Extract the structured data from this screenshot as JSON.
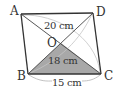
{
  "figure": {
    "type": "parallelogram-diagram",
    "vertices": {
      "A": {
        "label": "A",
        "x": 21,
        "y": 14
      },
      "B": {
        "label": "B",
        "x": 28,
        "y": 74
      },
      "C": {
        "label": "C",
        "x": 101,
        "y": 74
      },
      "D": {
        "label": "D",
        "x": 93,
        "y": 13
      },
      "O": {
        "label": "O",
        "x": 61,
        "y": 43
      }
    },
    "shaded_region": "triangle OBC",
    "measurements": {
      "diagonal_AC": "20 cm",
      "diagonal_BD": "18 cm",
      "side_BC": "15 cm"
    },
    "colors": {
      "outline": "#333333",
      "diagonal": "#444444",
      "shade": "#a8a8a8",
      "brace": "#bbbbbb",
      "text": "#333333"
    }
  }
}
